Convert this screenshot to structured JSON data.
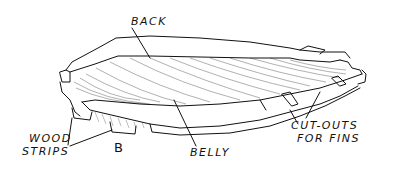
{
  "figure": {
    "ink_color": "#111111",
    "background": "#ffffff",
    "labels": {
      "back": "BACK",
      "belly": "BELLY",
      "wood_strips_line1": "WOOD",
      "wood_strips_line2": "STRIPS",
      "cutouts_line1": "CUT-OUTS",
      "cutouts_line2": "FOR FINS",
      "figure_letter": "B"
    }
  }
}
